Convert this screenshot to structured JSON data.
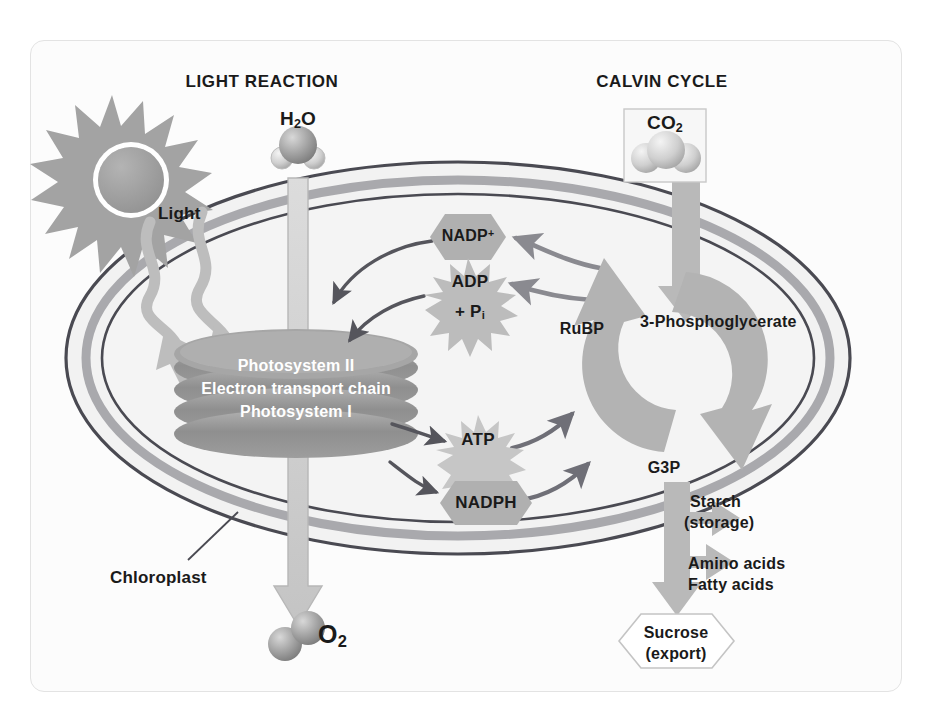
{
  "diagram": {
    "sections": {
      "light_reaction": "LIGHT REACTION",
      "calvin_cycle": "CALVIN CYCLE"
    },
    "inputs": {
      "water": "H₂O",
      "water_label_main": "H",
      "water_label_sub": "2",
      "water_label_tail": "O",
      "carbon_dioxide_main": "CO",
      "carbon_dioxide_sub": "2",
      "light": "Light"
    },
    "outputs": {
      "oxygen_main": "O",
      "oxygen_sub": "2"
    },
    "organelle": {
      "name": "Chloroplast"
    },
    "thylakoid": {
      "layers": [
        "Photosystem II",
        "Electron transport chain",
        "Photosystem I"
      ]
    },
    "carriers": [
      {
        "id": "nadp-plus",
        "label": "NADP",
        "charge": "+",
        "shape": "hexagon"
      },
      {
        "id": "adp",
        "label": "ADP",
        "shape": "starburst",
        "sublabel_prefix": "+ P",
        "sublabel_sub": "i"
      },
      {
        "id": "atp",
        "label": "ATP",
        "shape": "starburst"
      },
      {
        "id": "nadph",
        "label": "NADPH",
        "shape": "hexagon"
      }
    ],
    "cycle_intermediates": {
      "rubp": "RuBP",
      "three_pg": "3-Phosphoglycerate",
      "g3p": "G3P"
    },
    "products": {
      "starch_line1": "Starch",
      "starch_line2": "(storage)",
      "amino_acids": "Amino acids",
      "fatty_acids": "Fatty acids",
      "sucrose_line1": "Sucrose",
      "sucrose_line2": "(export)"
    },
    "colors": {
      "background": "#fcfcfc",
      "frame_border": "#e3e3e3",
      "membrane_dark": "#4a4a52",
      "membrane_band": "#a9a9ad",
      "stroma": "#f2f2f2",
      "thylakoid_disc": "#9a9a9a",
      "cycle_arrow": "#b3b3b3",
      "pale_arrow": "#c9c9c9",
      "dark_arrow": "#55555c",
      "mid_arrow": "#8a8a90",
      "sun": "#a8a8a8",
      "molecule": "#9d9d9d",
      "text": "#1a1a1a",
      "text_on_disc": "#ffffff"
    }
  }
}
